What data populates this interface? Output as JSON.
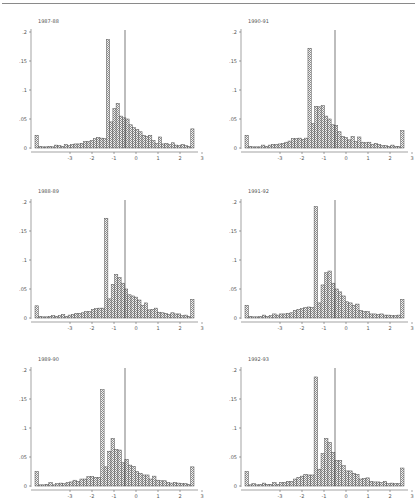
{
  "chart_data": [
    {
      "type": "bar",
      "title": "1987-88",
      "xlabel": "",
      "ylabel": "",
      "xlim": [
        -3.5,
        3.5
      ],
      "ylim": [
        0,
        0.2
      ],
      "xticks": [
        "-3",
        "-2",
        "-1",
        "0",
        "1",
        "2",
        "3"
      ],
      "yticks": [
        "0",
        ".05",
        ".1",
        ".15",
        ".2"
      ],
      "reference_line_x": -0.5,
      "bin_width": 0.15,
      "values": [
        0.022,
        0.003,
        0.002,
        0.002,
        0.003,
        0.002,
        0.005,
        0.004,
        0.003,
        0.006,
        0.004,
        0.006,
        0.007,
        0.007,
        0.008,
        0.011,
        0.011,
        0.013,
        0.016,
        0.018,
        0.017,
        0.016,
        0.187,
        0.045,
        0.068,
        0.077,
        0.055,
        0.052,
        0.05,
        0.04,
        0.035,
        0.032,
        0.028,
        0.022,
        0.02,
        0.022,
        0.013,
        0.008,
        0.019,
        0.007,
        0.008,
        0.006,
        0.009,
        0.005,
        0.004,
        0.006,
        0.004,
        0.003,
        0.033
      ]
    },
    {
      "type": "bar",
      "title": "1990-91",
      "xlabel": "",
      "ylabel": "",
      "xlim": [
        -3.5,
        3.5
      ],
      "ylim": [
        0,
        0.2
      ],
      "xticks": [
        "-3",
        "-2",
        "-1",
        "0",
        "1",
        "2",
        "3"
      ],
      "yticks": [
        "0",
        ".05",
        ".1",
        ".15",
        ".2"
      ],
      "reference_line_x": -0.5,
      "bin_width": 0.15,
      "values": [
        0.022,
        0.003,
        0.002,
        0.002,
        0.002,
        0.005,
        0.003,
        0.005,
        0.006,
        0.006,
        0.007,
        0.008,
        0.01,
        0.012,
        0.016,
        0.016,
        0.017,
        0.015,
        0.017,
        0.172,
        0.042,
        0.072,
        0.071,
        0.073,
        0.055,
        0.05,
        0.04,
        0.039,
        0.028,
        0.02,
        0.018,
        0.014,
        0.02,
        0.011,
        0.019,
        0.01,
        0.009,
        0.01,
        0.006,
        0.008,
        0.006,
        0.004,
        0.004,
        0.003,
        0.005,
        0.003,
        0.003,
        0.03
      ]
    },
    {
      "type": "bar",
      "title": "1988-89",
      "xlabel": "",
      "ylabel": "",
      "xlim": [
        -3.5,
        3.5
      ],
      "ylim": [
        0,
        0.2
      ],
      "xticks": [
        "-3",
        "-2",
        "-1",
        "0",
        "1",
        "2",
        "3"
      ],
      "yticks": [
        "0",
        ".05",
        ".1",
        ".15",
        ".2"
      ],
      "reference_line_x": -0.5,
      "bin_width": 0.15,
      "values": [
        0.021,
        0.003,
        0.002,
        0.002,
        0.003,
        0.004,
        0.003,
        0.004,
        0.006,
        0.003,
        0.005,
        0.006,
        0.008,
        0.008,
        0.009,
        0.011,
        0.011,
        0.015,
        0.016,
        0.017,
        0.017,
        0.172,
        0.033,
        0.058,
        0.075,
        0.07,
        0.06,
        0.05,
        0.04,
        0.038,
        0.036,
        0.031,
        0.022,
        0.026,
        0.014,
        0.015,
        0.017,
        0.01,
        0.009,
        0.008,
        0.006,
        0.009,
        0.007,
        0.007,
        0.004,
        0.005,
        0.003,
        0.032
      ]
    },
    {
      "type": "bar",
      "title": "1991-92",
      "xlabel": "",
      "ylabel": "",
      "xlim": [
        -3.5,
        3.5
      ],
      "ylim": [
        0,
        0.2
      ],
      "xticks": [
        "-3",
        "-2",
        "-1",
        "0",
        "1",
        "2",
        "3"
      ],
      "yticks": [
        "0",
        ".05",
        ".1",
        ".15",
        ".2"
      ],
      "reference_line_x": -0.5,
      "bin_width": 0.15,
      "values": [
        0.022,
        0.003,
        0.002,
        0.002,
        0.003,
        0.005,
        0.003,
        0.004,
        0.007,
        0.005,
        0.007,
        0.007,
        0.008,
        0.009,
        0.013,
        0.015,
        0.016,
        0.018,
        0.019,
        0.018,
        0.192,
        0.026,
        0.057,
        0.078,
        0.081,
        0.06,
        0.05,
        0.045,
        0.038,
        0.028,
        0.026,
        0.022,
        0.024,
        0.013,
        0.011,
        0.011,
        0.007,
        0.007,
        0.006,
        0.007,
        0.005,
        0.005,
        0.004,
        0.004,
        0.005,
        0.032
      ]
    },
    {
      "type": "bar",
      "title": "1989-90",
      "xlabel": "",
      "ylabel": "",
      "xlim": [
        -3.5,
        3.5
      ],
      "ylim": [
        0,
        0.2
      ],
      "xticks": [
        "-3",
        "-2",
        "-1",
        "0",
        "1",
        "2",
        "3"
      ],
      "yticks": [
        "0",
        ".05",
        ".1",
        ".15",
        ".2"
      ],
      "reference_line_x": -0.5,
      "bin_width": 0.15,
      "values": [
        0.025,
        0.002,
        0.002,
        0.003,
        0.006,
        0.002,
        0.004,
        0.005,
        0.004,
        0.006,
        0.007,
        0.01,
        0.008,
        0.012,
        0.012,
        0.016,
        0.016,
        0.015,
        0.015,
        0.166,
        0.033,
        0.06,
        0.082,
        0.063,
        0.062,
        0.04,
        0.046,
        0.036,
        0.034,
        0.025,
        0.022,
        0.019,
        0.019,
        0.012,
        0.017,
        0.01,
        0.009,
        0.009,
        0.006,
        0.005,
        0.006,
        0.005,
        0.004,
        0.004,
        0.003,
        0.033
      ]
    },
    {
      "type": "bar",
      "title": "1992-93",
      "xlabel": "",
      "ylabel": "",
      "xlim": [
        -3.5,
        3.5
      ],
      "ylim": [
        0,
        0.2
      ],
      "xticks": [
        "-3",
        "-2",
        "-1",
        "0",
        "1",
        "2",
        "3"
      ],
      "yticks": [
        "0",
        ".05",
        ".1",
        ".15",
        ".2"
      ],
      "reference_line_x": -0.5,
      "bin_width": 0.15,
      "values": [
        0.025,
        0.002,
        0.004,
        0.002,
        0.003,
        0.005,
        0.003,
        0.003,
        0.006,
        0.003,
        0.006,
        0.006,
        0.008,
        0.008,
        0.012,
        0.015,
        0.017,
        0.02,
        0.019,
        0.019,
        0.188,
        0.029,
        0.056,
        0.082,
        0.075,
        0.058,
        0.044,
        0.044,
        0.035,
        0.026,
        0.026,
        0.022,
        0.02,
        0.012,
        0.013,
        0.014,
        0.008,
        0.007,
        0.007,
        0.006,
        0.008,
        0.004,
        0.005,
        0.004,
        0.004,
        0.031
      ]
    }
  ]
}
